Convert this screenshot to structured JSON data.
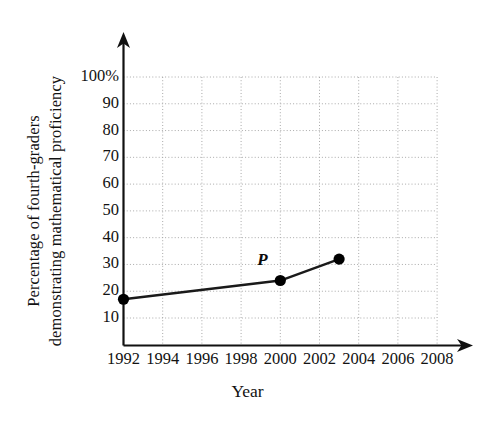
{
  "axis": {
    "y_title_line1": "Percentage of fourth-graders",
    "y_title_line2": "demonstrating mathematical proficiency",
    "x_title": "Year"
  },
  "chart_data": {
    "type": "line",
    "title": "",
    "xlabel": "Year",
    "ylabel": "Percentage of fourth-graders demonstrating mathematical proficiency",
    "x": [
      1992,
      2000,
      2003
    ],
    "values": [
      17,
      24,
      32
    ],
    "series": [
      {
        "name": "percent proficient",
        "points": [
          {
            "x": 1992,
            "y": 17,
            "label": ""
          },
          {
            "x": 2000,
            "y": 24,
            "label": "P"
          },
          {
            "x": 2003,
            "y": 32,
            "label": ""
          }
        ]
      }
    ],
    "xlim": [
      1992,
      2008
    ],
    "ylim": [
      0,
      100
    ],
    "xticks": [
      "1992",
      "1994",
      "1996",
      "1998",
      "2000",
      "2002",
      "2004",
      "2006",
      "2008"
    ],
    "xtick_values": [
      1992,
      1994,
      1996,
      1998,
      2000,
      2002,
      2004,
      2006,
      2008
    ],
    "yticks": [
      "10",
      "20",
      "30",
      "40",
      "50",
      "60",
      "70",
      "80",
      "90",
      "100%"
    ],
    "ytick_values": [
      10,
      20,
      30,
      40,
      50,
      60,
      70,
      80,
      90,
      100
    ],
    "grid": true,
    "grid_style": "dotted",
    "legend": "none",
    "annotations": [
      {
        "text": "P",
        "x": 2000,
        "y": 24,
        "position": "above-left"
      }
    ],
    "colors": {
      "line": "#1a1a1a",
      "marker": "#000000",
      "grid": "#a9a9a9",
      "axis": "#111111",
      "background": "#ffffff"
    }
  }
}
